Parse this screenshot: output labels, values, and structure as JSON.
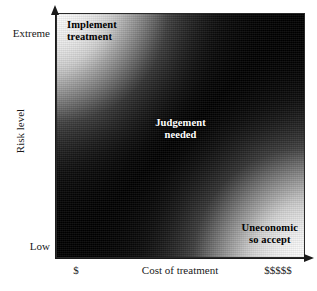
{
  "chart_data": {
    "type": "heatmap",
    "title": "",
    "xlabel": "Cost of treatment",
    "ylabel": "Risk level",
    "x_tick_labels": [
      "$",
      "$$$$$"
    ],
    "y_tick_labels": [
      "Low",
      "Extreme"
    ],
    "grid": false,
    "legend": "none",
    "colormap": "grayscale",
    "colormap_description": "Dark diagonal band from bottom-left to top-right; light grey at top-left and bottom-right corners",
    "xlim": [
      "$",
      "$$$$$"
    ],
    "ylim": [
      "Low",
      "Extreme"
    ],
    "regions": [
      {
        "id": "implement-treatment",
        "label": "Implement\ntreatment",
        "x_position": "low-cost",
        "y_position": "extreme-risk",
        "corner": "top-left",
        "text_color": "#000000",
        "shade": "light"
      },
      {
        "id": "judgement-needed",
        "label": "Judgement\nneeded",
        "x_position": "mid-cost",
        "y_position": "mid-risk",
        "corner": "center",
        "text_color": "#ffffff",
        "shade": "dark"
      },
      {
        "id": "uneconomic-so-accept",
        "label": "Uneconomic\nso accept",
        "x_position": "high-cost",
        "y_position": "low-risk",
        "corner": "bottom-right",
        "text_color": "#000000",
        "shade": "light"
      }
    ]
  },
  "axes": {
    "y": {
      "title": "Risk level",
      "top_label": "Extreme",
      "bottom_label": "Low",
      "arrow": "up-arrow-icon"
    },
    "x": {
      "title": "Cost of treatment",
      "left_label": "$",
      "right_label": "$$$$$",
      "arrow": "right-arrow-icon"
    }
  },
  "plot": {
    "regions": {
      "top_left": "Implement\ntreatment",
      "center": "Judgement\nneeded",
      "bottom_right": "Uneconomic\nso accept"
    }
  },
  "colors": {
    "background": "#ffffff",
    "axis": "#1a1a1a",
    "band_dark": "#000000",
    "corner_light": "#e6e6e6",
    "center_text": "#ffffff"
  }
}
